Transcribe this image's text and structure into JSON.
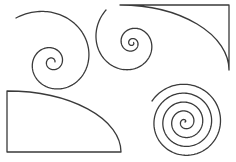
{
  "canvas": {
    "width": 236,
    "height": 162,
    "background": "#ffffff",
    "stroke_color": "#3a3a3a"
  },
  "shapes": [
    {
      "id": "spiral-top-left",
      "type": "log-spiral",
      "center": [
        52,
        62
      ],
      "start_radius": 1.5,
      "growth": 0.2,
      "turns": 2.35,
      "start_angle_deg": 0,
      "direction": "ccw-outward",
      "end_point_approx": [
        16,
        18
      ]
    },
    {
      "id": "spiral-top-middle",
      "type": "log-spiral",
      "center": [
        132,
        43
      ],
      "start_radius": 1.5,
      "growth": 0.19,
      "turns": 2.7,
      "start_angle_deg": 0,
      "direction": "cw-outward",
      "end_point_approx": [
        106,
        10
      ]
    },
    {
      "id": "quarter-shape-top-right",
      "type": "quarter-ellipse-frame",
      "corner": [
        229,
        5
      ],
      "arc_start": [
        120,
        5
      ],
      "arc_end": [
        229,
        70
      ],
      "edges": [
        "top",
        "right"
      ]
    },
    {
      "id": "quarter-shape-bottom-left",
      "type": "quarter-ellipse-frame",
      "corner": [
        7,
        152
      ],
      "arc_start": [
        7,
        91
      ],
      "arc_end": [
        121,
        152
      ],
      "edges": [
        "left",
        "bottom"
      ]
    },
    {
      "id": "spiral-bottom-right",
      "type": "archimedean-spiral",
      "center": [
        185,
        122
      ],
      "start_radius": 0,
      "spacing": 8.5,
      "turns": 4.4,
      "start_angle_deg": 0,
      "direction": "ccw-outward",
      "end_point_approx": [
        152,
        101
      ]
    }
  ]
}
